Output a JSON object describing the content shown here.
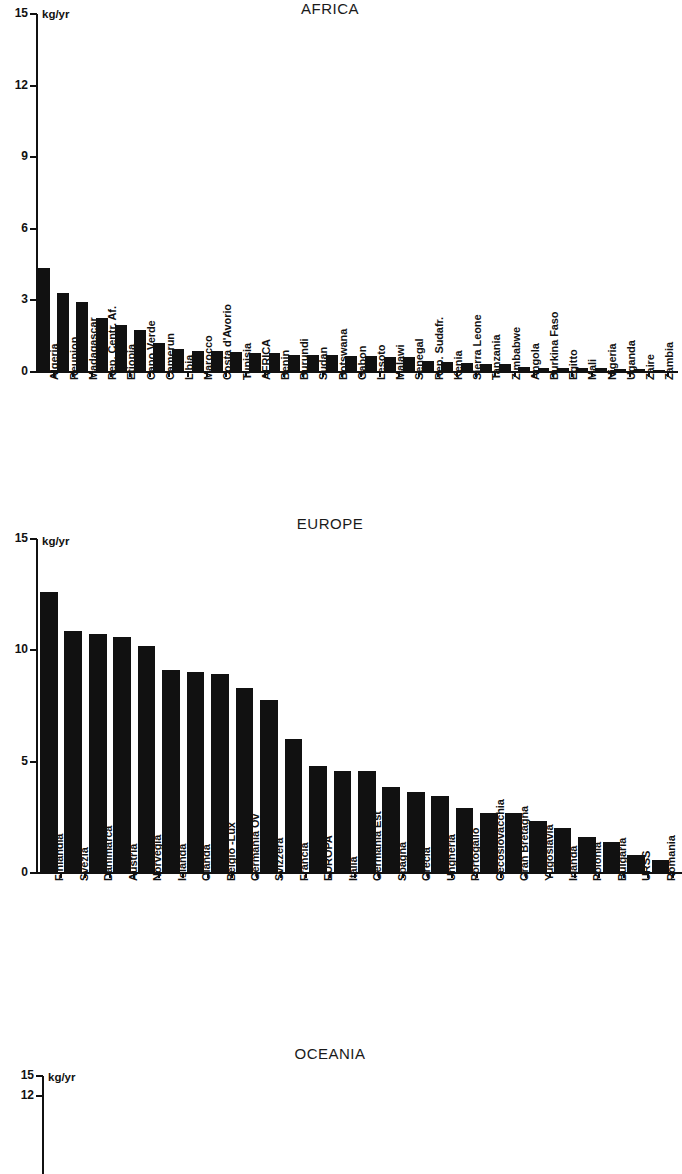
{
  "figure": {
    "unit": "kg/yr",
    "panels": [
      "AFRICA",
      "EUROPE",
      "OCEANIA"
    ]
  },
  "chart_data": [
    {
      "type": "bar",
      "title": "AFRICA",
      "xlabel": "",
      "ylabel": "kg/yr",
      "ylim": [
        0,
        15
      ],
      "yticks": [
        0,
        3,
        6,
        9,
        12,
        15
      ],
      "grid": false,
      "legend": null,
      "categories": [
        "Algeria",
        "Reunion",
        "Madagascar",
        "Rep. Centr. Af.",
        "Etiopia",
        "Capo Verde",
        "Camerun",
        "Libia",
        "Marocco",
        "Costa d'Avorio",
        "Tunisia",
        "AFRICA",
        "Benin",
        "Burundi",
        "Sudan",
        "Botswana",
        "Gabon",
        "Lesoto",
        "Malawi",
        "Senegal",
        "Rep. Sudafr.",
        "Kenia",
        "Sierra Leone",
        "Tanzania",
        "Zimbabwe",
        "Angola",
        "Burkina Faso",
        "Egitto",
        "Mali",
        "Nigeria",
        "Uganda",
        "Zaire",
        "Zambia"
      ],
      "values": [
        4.35,
        3.3,
        2.95,
        2.25,
        1.95,
        1.75,
        1.2,
        0.95,
        0.9,
        0.88,
        0.85,
        0.8,
        0.78,
        0.72,
        0.7,
        0.7,
        0.68,
        0.66,
        0.64,
        0.62,
        0.45,
        0.4,
        0.38,
        0.35,
        0.33,
        0.2,
        0.18,
        0.17,
        0.16,
        0.15,
        0.13,
        0.12,
        0.1
      ]
    },
    {
      "type": "bar",
      "title": "EUROPE",
      "xlabel": "",
      "ylabel": "kg/yr",
      "ylim": [
        0,
        15
      ],
      "yticks": [
        0,
        5,
        10,
        15
      ],
      "grid": false,
      "legend": null,
      "categories": [
        "Finlandia",
        "Svezia",
        "Danimarca",
        "Austria",
        "Norvegia",
        "Islanda",
        "Olanda",
        "Belgio -Lux",
        "Germania Ov",
        "Svizzera",
        "Francia",
        "EUROPA",
        "Italia",
        "Germania Est",
        "Spagna",
        "Grecia",
        "Ungheria",
        "Portogallo",
        "Cecoslovacchia",
        "Gran Bretagna",
        "Yugoslavia",
        "Irlanda",
        "Polonia",
        "Bulgaria",
        "URSS",
        "Romania"
      ],
      "values": [
        12.6,
        10.85,
        10.75,
        10.6,
        10.2,
        9.1,
        9.05,
        8.95,
        8.3,
        7.75,
        6.0,
        4.8,
        4.6,
        4.6,
        3.85,
        3.65,
        3.45,
        2.9,
        2.7,
        2.7,
        2.35,
        2.0,
        1.6,
        1.4,
        0.8,
        0.6
      ]
    },
    {
      "type": "bar",
      "title": "OCEANIA",
      "xlabel": "",
      "ylabel": "kg/yr",
      "ylim": [
        0,
        15
      ],
      "yticks": [
        12,
        15
      ],
      "grid": false,
      "legend": null,
      "categories": [],
      "values": []
    }
  ]
}
